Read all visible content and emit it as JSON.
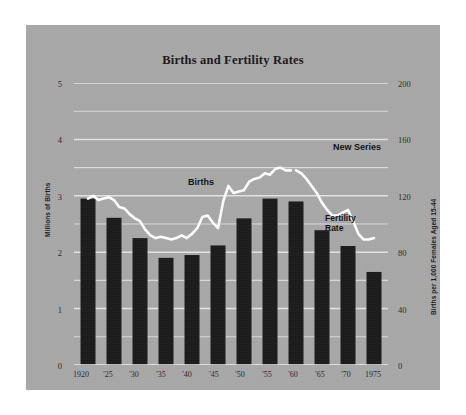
{
  "chart_data": {
    "type": "bar",
    "title": "Births and Fertility Rates",
    "categories": [
      "1920",
      "'25",
      "'30",
      "'35",
      "'40",
      "'45",
      "'50",
      "'55",
      "'60",
      "'65",
      "'70",
      "1975"
    ],
    "series": [
      {
        "name": "Births",
        "kind": "bar",
        "unit": "Millions of Births",
        "axis": "left",
        "values": [
          2.95,
          2.61,
          2.25,
          1.9,
          1.95,
          2.12,
          2.6,
          2.95,
          2.9,
          2.39,
          2.11,
          1.65
        ]
      },
      {
        "name": "Fertility Rate",
        "kind": "line",
        "unit": "Births per 1,000 Females Aged 15-44",
        "axis": "right",
        "x": [
          1920,
          1921,
          1922,
          1923,
          1924,
          1925,
          1926,
          1927,
          1928,
          1929,
          1930,
          1931,
          1932,
          1933,
          1934,
          1935,
          1936,
          1937,
          1938,
          1939,
          1940,
          1941,
          1942,
          1943,
          1944,
          1945,
          1946,
          1947,
          1948,
          1949,
          1950,
          1951,
          1952,
          1953,
          1954,
          1955,
          1956,
          1957,
          1958,
          1959,
          1960,
          1961,
          1962,
          1963,
          1964,
          1965,
          1966,
          1967,
          1968,
          1969,
          1970,
          1971,
          1972,
          1973,
          1974,
          1975
        ],
        "values": [
          118,
          120,
          117,
          118,
          119,
          117,
          112,
          111,
          107,
          104,
          102,
          96,
          92,
          90,
          91,
          90,
          89,
          90,
          92,
          90,
          93,
          97,
          105,
          106,
          101,
          97,
          116,
          127,
          122,
          123,
          124,
          130,
          132,
          133,
          136,
          135,
          139,
          140,
          138,
          138,
          138,
          136,
          132,
          127,
          122,
          115,
          110,
          106,
          106,
          108,
          110,
          102,
          93,
          89,
          89,
          90
        ],
        "break_after_year": 1959,
        "break_note": "New Series"
      }
    ],
    "left_axis": {
      "label": "Millions of Births",
      "ticks": [
        "0",
        "1",
        "2",
        "3",
        "4",
        "5"
      ],
      "min": 0,
      "max": 5
    },
    "right_axis": {
      "label": "Births per 1,000 Females Aged 15-44",
      "ticks": [
        "0",
        "40",
        "80",
        "120",
        "160",
        "200"
      ],
      "min": 0,
      "max": 200
    },
    "annotations": [
      {
        "name": "births-annotation",
        "text": "Births"
      },
      {
        "name": "new-series-annotation",
        "text": "New Series"
      },
      {
        "name": "fertility-rate-annotation-line1",
        "text": "Fertility"
      },
      {
        "name": "fertility-rate-annotation-line2",
        "text": "Rate"
      }
    ],
    "grid": true,
    "legend_position": "inline-annotations",
    "colors": {
      "panel_background": "#a8a8a8",
      "page_background": "#ffffff",
      "bar": "#1a1a1a",
      "line": "#ffffff",
      "grid": "#e8e8e8",
      "text": "#1b1b1b"
    }
  }
}
